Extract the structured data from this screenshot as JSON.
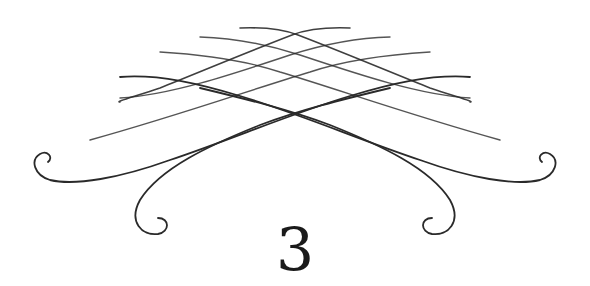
{
  "ornament": {
    "name": "chapter-divider-flourish",
    "stroke_color": "#2a2a2a",
    "background": "#ffffff"
  },
  "chapter": {
    "number": "3"
  }
}
